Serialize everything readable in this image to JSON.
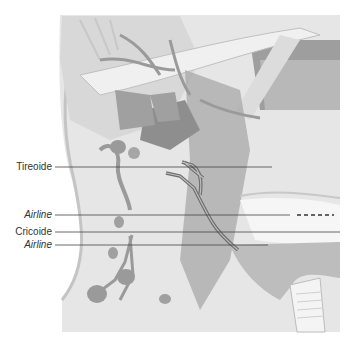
{
  "figure": {
    "labels": [
      {
        "id": "tireoide",
        "text": "Tireoide",
        "italic": false
      },
      {
        "id": "airline-1",
        "text": "Airline",
        "italic": true
      },
      {
        "id": "cricoide",
        "text": "Cricoide",
        "italic": false
      },
      {
        "id": "airline-2",
        "text": "Airline",
        "italic": true
      }
    ],
    "colors": {
      "background": "#ffffff",
      "skin": "#e4e4e4",
      "muscle": "#cfcfcf",
      "dark_tissue": "#9a9a9a",
      "vessel": "#8c8c8c",
      "leader_line": "#444444",
      "label_text": "#333333"
    }
  }
}
